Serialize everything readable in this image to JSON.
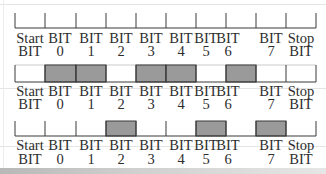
{
  "diagram": {
    "title_fragment": "",
    "cells": [
      {
        "top": "Start",
        "bottom": "BIT"
      },
      {
        "top": "BIT",
        "bottom": "0"
      },
      {
        "top": "BIT",
        "bottom": "1"
      },
      {
        "top": "BIT",
        "bottom": "2"
      },
      {
        "top": "BIT",
        "bottom": "3"
      },
      {
        "top": "BIT",
        "bottom": "4"
      },
      {
        "top": "BIT",
        "bottom": "5"
      },
      {
        "top": "BIT",
        "bottom": "6"
      },
      {
        "top": "BIT",
        "bottom": "7"
      },
      {
        "top": "Stop",
        "bottom": "BIT"
      }
    ],
    "rows": [
      {
        "name": "empty-frame",
        "bits": [
          0,
          0,
          0,
          0,
          0,
          0,
          0,
          0,
          0,
          0
        ],
        "boxed": false
      },
      {
        "name": "frame-a",
        "bits": [
          0,
          1,
          1,
          0,
          1,
          1,
          0,
          1,
          0,
          0
        ],
        "boxed": true
      },
      {
        "name": "frame-b",
        "bits": [
          0,
          0,
          0,
          1,
          0,
          0,
          1,
          0,
          1,
          0
        ],
        "boxed": false
      }
    ],
    "colors": {
      "fill": "#9a9a9a",
      "stroke": "#3a3a3a",
      "background": "#ffffff"
    }
  }
}
